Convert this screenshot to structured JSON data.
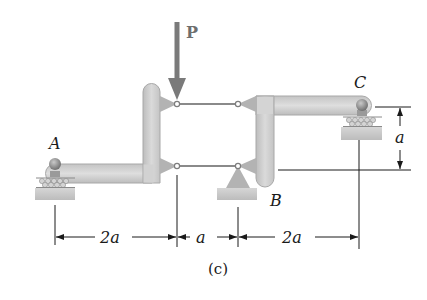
{
  "figure": {
    "caption": "(c)",
    "load": {
      "label": "P",
      "color": "#7a7a7a"
    },
    "points": {
      "A": {
        "label": "A"
      },
      "B": {
        "label": "B"
      },
      "C": {
        "label": "C"
      }
    },
    "dimensions": {
      "horizontal": [
        {
          "label": "2a"
        },
        {
          "label": "a"
        },
        {
          "label": "2a"
        }
      ],
      "vertical": {
        "label": "a"
      }
    },
    "colors": {
      "member_fill": "#cfcfcf",
      "member_stroke": "#a8a8a8",
      "gusset": "#b3b3b3",
      "link": "#8a8a8a",
      "ground": "#c8c8c8",
      "roller": "#bdbdbd",
      "pin": "#7d7d7d",
      "dimension": "#1a1a1a"
    }
  }
}
